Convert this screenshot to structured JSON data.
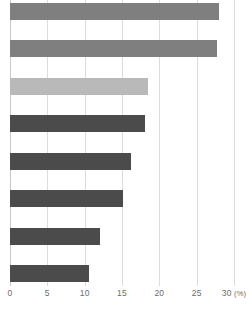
{
  "chart_data": {
    "type": "bar",
    "orientation": "horizontal",
    "title": "",
    "xlabel": "(%)",
    "ylabel": "",
    "xlim": [
      0,
      30
    ],
    "xticks": [
      0,
      5,
      10,
      15,
      20,
      25,
      30
    ],
    "xtick_labels": [
      "0",
      "5",
      "10",
      "15",
      "20",
      "25",
      "30"
    ],
    "unit_label": "(%)",
    "grid": true,
    "legend": "none",
    "categories": [
      "",
      "",
      "",
      "",
      "",
      "",
      "",
      ""
    ],
    "values": [
      28.0,
      27.7,
      18.5,
      18.1,
      16.2,
      15.1,
      12.0,
      10.6
    ],
    "bar_colors": [
      "#7f7f7f",
      "#7f7f7f",
      "#b9b9b9",
      "#4b4b4b",
      "#4b4b4b",
      "#4b4b4b",
      "#4b4b4b",
      "#4b4b4b"
    ],
    "grid_color": "#dcdcdc",
    "axis_color": "#c9c9c9",
    "tick_text_color": "#6b6b6b",
    "background": "#ffffff"
  }
}
